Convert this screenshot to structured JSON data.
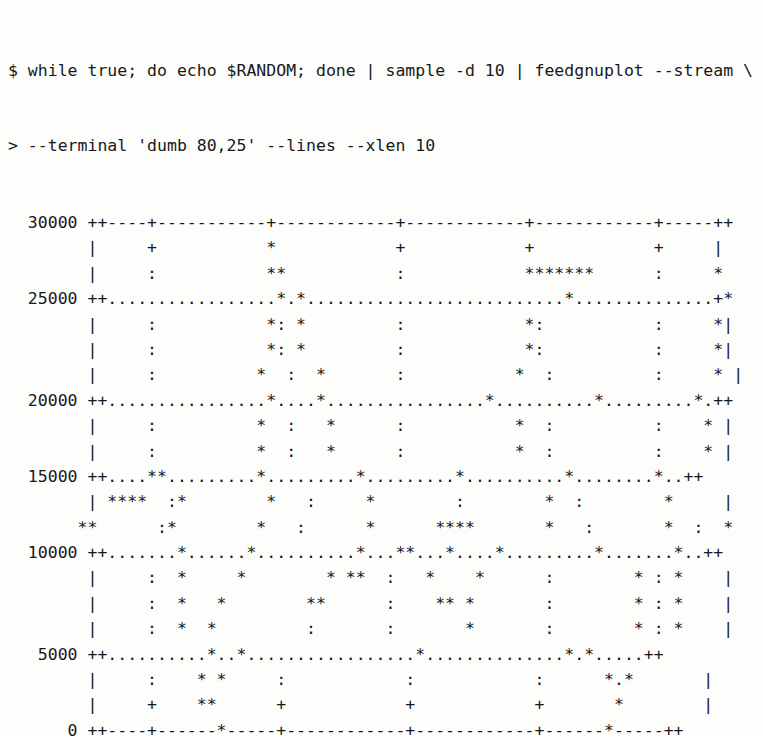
{
  "terminal": {
    "background_color": "#fdfdfb",
    "foreground_color": "#18181a",
    "columns": 80,
    "rows": 25
  },
  "command": {
    "prompt_primary": "$",
    "prompt_continuation": ">",
    "line1": "$ while true; do echo $RANDOM; done | sample -d 10 | feedgnuplot --stream \\",
    "line2": "> --terminal 'dumb 80,25' --lines --xlen 10"
  },
  "plot": {
    "terminal_type": "dumb 80,25",
    "lines": [
      "  30000 ++----+-----------+------------+------------+------------+-----++",
      "        |     +           *            +            +            +     |",
      "        |     :           **           :            *******      :     *",
      "  25000 ++.................*.*..........................*..............+*",
      "        |     :           *: *         :            *:           :     *|",
      "        |     :           *: *         :            *:           :     *|",
      "        |     :          *  :  *       :           *  :          :     * |",
      "  20000 ++................*....*................*..........*.........*.++",
      "        |     :          *  :   *      :           *  :          :    * |",
      "        |     :          *  :   *      :           *  :          :    * |",
      "  15000 ++....**.........*.........*.........*..........*........*..++",
      "        | ****  :*        *   :     *        :        *  :        *     |",
      "       **      :*        *   :      *      ****       *   :       *  :  *",
      "  10000 ++.......*......*..........*...**...*....*.........*.......*..++",
      "        |     :  *     *        * **  :   *    *      :        * : *    |",
      "        |     :  *   *        **      :    ** *       :        * : *    |",
      "        |     :  *  *         :       :       *       :        * : *    |",
      "   5000 ++..........*..*.................*..............*.*.....++",
      "        |     :    * *     :            :            :      *.*       |",
      "        |     +    **      +            +            +       *        |",
      "      0 ++----+------*-----+------------+------------+------*-----++"
    ],
    "yaxis": {
      "label": "",
      "ticks": [
        "30000",
        "25000",
        "20000",
        "15000",
        "10000",
        "5000",
        "0"
      ],
      "min": 0,
      "max": 30000,
      "tick_step": 5000
    },
    "xaxis": {
      "label": "",
      "ticks": [
        "2350",
        "2352",
        "2354",
        "2356",
        "2358"
      ],
      "min": 2349,
      "max": 2359,
      "tick_step": 2,
      "window_length": 10
    },
    "grid_char": ".",
    "data_char": "*",
    "tick_char": "+",
    "border_char": "-"
  },
  "chart_data": {
    "type": "line",
    "title": "",
    "xlabel": "",
    "ylabel": "",
    "xlim": [
      2349,
      2359
    ],
    "ylim": [
      0,
      30000
    ],
    "xticks": [
      2350,
      2352,
      2354,
      2356,
      2358
    ],
    "yticks": [
      0,
      5000,
      10000,
      15000,
      20000,
      25000,
      30000
    ],
    "grid": true,
    "legend": "none",
    "renderer": "gnuplot dumb 80,25",
    "series": [
      {
        "name": "$RANDOM stream",
        "x": [
          2349.0,
          2349.2,
          2349.4,
          2349.6,
          2349.8,
          2350.0,
          2350.2,
          2350.4,
          2350.6,
          2350.8,
          2351.0,
          2351.2,
          2351.4,
          2351.6,
          2351.8,
          2352.0,
          2352.2,
          2352.4,
          2352.6,
          2352.8,
          2353.0,
          2353.2,
          2353.4,
          2353.6,
          2353.8,
          2354.0,
          2354.2,
          2354.4,
          2354.6,
          2354.8,
          2355.0,
          2355.2,
          2355.4,
          2355.6,
          2355.8,
          2356.0,
          2356.2,
          2356.4,
          2356.6,
          2356.8,
          2357.0,
          2357.2,
          2357.4,
          2357.6,
          2357.8,
          2358.0,
          2358.2,
          2358.4,
          2358.6,
          2358.8,
          2359.0
        ],
        "y": [
          12900,
          13500,
          14900,
          13800,
          12800,
          9200,
          6500,
          4300,
          2600,
          800,
          4500,
          8000,
          11500,
          15500,
          19500,
          24300,
          28000,
          27000,
          23000,
          18500,
          14000,
          9500,
          6200,
          8300,
          12500,
          13000,
          12900,
          9800,
          5200,
          2000,
          6000,
          11000,
          15800,
          20500,
          25000,
          28500,
          28500,
          28500,
          28500,
          28500,
          25500,
          21000,
          16500,
          12000,
          8500,
          6800,
          9500,
          14500,
          19500,
          24500,
          26200
        ]
      }
    ]
  }
}
